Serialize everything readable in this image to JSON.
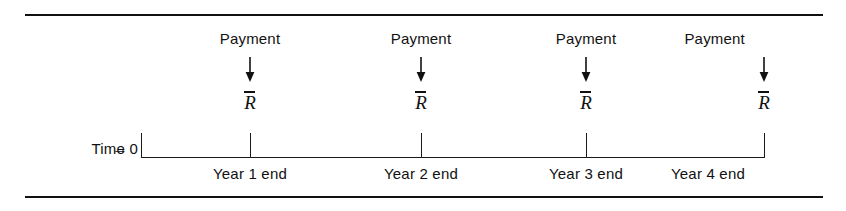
{
  "figure": {
    "background_color": "#ffffff",
    "line_color": "#111111"
  },
  "axis": {
    "start_label": "Time 0",
    "start_arrow": "→",
    "arrow_icon_name": "right-arrow-icon"
  },
  "periods": [
    {
      "payment_label": "Payment",
      "arrow": "↓",
      "symbol": "R",
      "year_label": "Year 1 end"
    },
    {
      "payment_label": "Payment",
      "arrow": "↓",
      "symbol": "R",
      "year_label": "Year 2 end"
    },
    {
      "payment_label": "Payment",
      "arrow": "↓",
      "symbol": "R",
      "year_label": "Year 3 end"
    },
    {
      "payment_label": "Payment",
      "arrow": "↓",
      "symbol": "R",
      "year_label": "Year 4 end"
    }
  ]
}
